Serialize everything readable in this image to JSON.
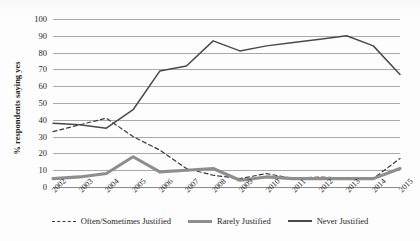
{
  "chart_data": {
    "type": "line",
    "title": "",
    "xlabel": "",
    "ylabel": "% respondents saying yes",
    "categories": [
      "2002",
      "2003",
      "2004",
      "2005",
      "2006",
      "2007",
      "2008",
      "2009",
      "2010",
      "2011",
      "2012",
      "2013",
      "2014",
      "2015"
    ],
    "ylim": [
      0,
      100
    ],
    "ytick_values": [
      0,
      10,
      20,
      30,
      40,
      50,
      60,
      70,
      80,
      90,
      100
    ],
    "ytick_labels": [
      "0",
      "10",
      "20",
      "30",
      "40",
      "50",
      "60",
      "70",
      "80",
      "90",
      "100"
    ],
    "grid": true,
    "legend_position": "bottom",
    "series": [
      {
        "name": "Often/Sometimes Justified",
        "style": "dashed",
        "color": "#3a3a3a",
        "values": [
          33,
          37,
          41,
          30,
          22,
          11,
          7,
          5,
          8,
          5,
          6,
          5,
          5,
          17
        ]
      },
      {
        "name": "Rarely Justified",
        "style": "solid-thick",
        "color": "#8e8e8e",
        "values": [
          5,
          6,
          8,
          18,
          9,
          10,
          11,
          4,
          6,
          5,
          5,
          5,
          5,
          11
        ]
      },
      {
        "name": "Never Justified",
        "style": "solid-thin",
        "color": "#4a4a4a",
        "values": [
          38,
          37,
          35,
          46,
          69,
          72,
          87,
          81,
          84,
          86,
          88,
          90,
          84,
          67
        ]
      }
    ]
  },
  "legend": {
    "items": [
      {
        "label": "Often/Sometimes Justified",
        "swatch": "dashed-line-icon"
      },
      {
        "label": "Rarely Justified",
        "swatch": "thick-line-icon"
      },
      {
        "label": "Never Justified",
        "swatch": "thin-line-icon"
      }
    ]
  },
  "axes": {
    "y_axis_title": "% respondents saying yes"
  }
}
